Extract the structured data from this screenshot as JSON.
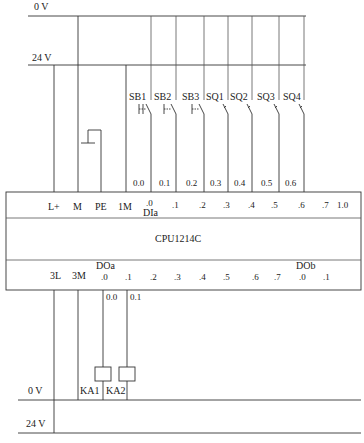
{
  "diagram": {
    "supply_top": {
      "zero_v": "0 V",
      "twentyfour_v": "24 V"
    },
    "supply_bottom": {
      "zero_v": "0 V",
      "twentyfour_v": "24 V"
    },
    "inputs": [
      {
        "device": "SB1",
        "address": "0.0",
        "type": "pushbutton"
      },
      {
        "device": "SB2",
        "address": "0.1",
        "type": "pushbutton"
      },
      {
        "device": "SB3",
        "address": "0.2",
        "type": "pushbutton"
      },
      {
        "device": "SQ1",
        "address": "0.3",
        "type": "limit-switch"
      },
      {
        "device": "SQ2",
        "address": "0.4",
        "type": "limit-switch"
      },
      {
        "device": "SQ3",
        "address": "0.5",
        "type": "limit-switch"
      },
      {
        "device": "SQ4",
        "address": "0.6",
        "type": "limit-switch"
      }
    ],
    "plc": {
      "model": "CPU1214C",
      "top_terminals": [
        "L+",
        "M",
        "PE",
        "1M",
        ".0",
        ".1",
        ".2",
        ".3",
        ".4",
        ".5",
        ".6",
        ".7",
        "1.0"
      ],
      "di_group_label": "DIa",
      "bottom_terminals": [
        "3L",
        "3M",
        ".0",
        ".1",
        ".2",
        ".3",
        ".4",
        ".5",
        ".6",
        ".7",
        ".0",
        ".1"
      ],
      "doa_group_label": "DOa",
      "dob_group_label": "DOb"
    },
    "outputs": [
      {
        "device": "KA1",
        "address": "0.0",
        "type": "relay-coil"
      },
      {
        "device": "KA2",
        "address": "0.1",
        "type": "relay-coil"
      }
    ]
  }
}
